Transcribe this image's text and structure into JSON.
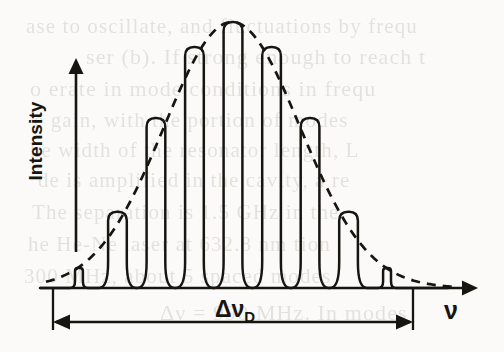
{
  "figure": {
    "name": "doppler-gain-profile-with-laser-modes",
    "background_color": "#fbfaf8",
    "ink_color": "#17150f",
    "axes": {
      "y_axis_label": "Intensity",
      "x_axis_label": "ν",
      "y_axis_arrow": true,
      "x_axis_arrow": true,
      "baseline_y": 288,
      "y_axis_x": 76,
      "y_axis_top": 62,
      "y_axis_bottom": 252,
      "x_axis_left": 40,
      "x_axis_right": 472
    },
    "width_marker": {
      "label": "Δν",
      "subscript": "D",
      "left_x": 53,
      "right_x": 413,
      "arrow_y": 322,
      "tick_top_y": 288,
      "tick_bottom_y": 330,
      "double_headed": true
    },
    "envelope": {
      "name": "doppler-gaussian-envelope",
      "style": "dashed",
      "center_x": 232,
      "peak_y": 22,
      "sigma_x": 96,
      "dash_pattern": "9 7"
    },
    "peaks_note": "nine longitudinal cavity modes, evenly spaced, clipped by the Gaussian gain envelope"
  },
  "chart_data": {
    "type": "line",
    "title": "",
    "xlabel": "ν",
    "ylabel": "Intensity",
    "legend": [],
    "grid": false,
    "xlim": [
      0,
      1
    ],
    "ylim": [
      0,
      1
    ],
    "series": [
      {
        "name": "Doppler gain profile (envelope)",
        "style": "dashed",
        "type": "gaussian-envelope",
        "center": 0.5,
        "amplitude": 1.0,
        "fwhm_label": "Δν_D",
        "x": [
          0.0,
          0.06,
          0.12,
          0.18,
          0.24,
          0.3,
          0.36,
          0.42,
          0.5,
          0.58,
          0.64,
          0.7,
          0.76,
          0.82,
          0.88,
          0.94,
          1.0
        ],
        "y": [
          0.03,
          0.06,
          0.12,
          0.21,
          0.34,
          0.5,
          0.68,
          0.86,
          1.0,
          0.86,
          0.68,
          0.5,
          0.34,
          0.21,
          0.12,
          0.06,
          0.03
        ]
      },
      {
        "name": "Longitudinal cavity modes",
        "style": "solid",
        "type": "modes",
        "mode_count": 9,
        "x": [
          0.072,
          0.179,
          0.286,
          0.393,
          0.5,
          0.607,
          0.714,
          0.821,
          0.928
        ],
        "y": [
          0.075,
          0.287,
          0.639,
          0.906,
          1.0,
          0.906,
          0.639,
          0.287,
          0.075
        ],
        "mode_spacing_label": "",
        "mode_width_fraction": 0.052
      }
    ],
    "annotations": [
      {
        "text": "Δν_D",
        "role": "doppler-width-marker",
        "x": 0.5,
        "y": -0.14
      }
    ]
  },
  "ghost_text": {
    "note": "faint bleed-through from reverse page of the scanned book",
    "lines": [
      {
        "text": "ase to oscillate, and fluctuations by frequ",
        "x": 26,
        "y": 14,
        "size": 21
      },
      {
        "text": "ser (b). If strong enough to reach t",
        "x": 86,
        "y": 44,
        "size": 22
      },
      {
        "text": "o erate in mode conditions in frequ",
        "x": 30,
        "y": 76,
        "size": 22
      },
      {
        "text": "e gain, with the portion of modes",
        "x": 34,
        "y": 108,
        "size": 21
      },
      {
        "text": "he width of the resonator length, L",
        "x": 30,
        "y": 138,
        "size": 21
      },
      {
        "text": "de is amplified in the cavity, a re",
        "x": 38,
        "y": 168,
        "size": 21
      },
      {
        "text": "The separation is 1.5 GHz in the",
        "x": 32,
        "y": 200,
        "size": 21
      },
      {
        "text": "he He-Ne laser at 632.8 nm tion",
        "x": 28,
        "y": 232,
        "size": 21
      },
      {
        "text": "300 MHz, about 5 spaced modes",
        "x": 24,
        "y": 264,
        "size": 21
      },
      {
        "text": "Δν = 990 MHz. In modes",
        "x": 160,
        "y": 300,
        "size": 22
      }
    ]
  }
}
